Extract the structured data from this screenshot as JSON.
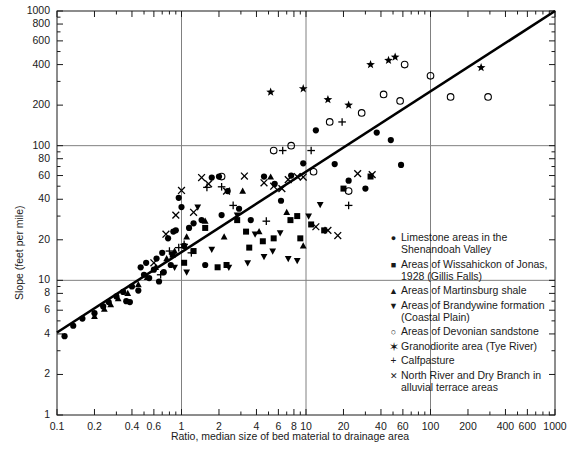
{
  "chart_data": {
    "type": "scatter",
    "title": "",
    "xlabel": "Ratio, median size of bed material to drainage area",
    "ylabel": "Slope (feet per mile)",
    "xscale": "log",
    "yscale": "log",
    "xlim": [
      0.1,
      1000
    ],
    "ylim": [
      1,
      1000
    ],
    "grid": "major lines at x=1, x=10, x=100 and y=10, y=100",
    "xticks": [
      0.1,
      0.2,
      0.4,
      0.6,
      1,
      2,
      4,
      6,
      8,
      10,
      20,
      40,
      60,
      100,
      200,
      400,
      600,
      1000
    ],
    "xticklabels": [
      "0.1",
      "0.2",
      "0.4",
      "0.6",
      "1",
      "2",
      "4",
      "6",
      "8",
      "10",
      "20",
      "40",
      "60",
      "100",
      "200",
      "400",
      "600",
      "1000"
    ],
    "yticks": [
      1,
      2,
      4,
      6,
      8,
      10,
      20,
      40,
      60,
      80,
      100,
      200,
      400,
      600,
      800,
      1000
    ],
    "yticklabels": [
      "1",
      "2",
      "4",
      "6",
      "8",
      "10",
      "20",
      "40",
      "60",
      "80",
      "100",
      "200",
      "400",
      "600",
      "800",
      "1000"
    ],
    "legend_position": "lower right, inside axes",
    "trendline": {
      "x": [
        0.1,
        1000
      ],
      "y": [
        4.1,
        1000
      ],
      "style": "solid",
      "width": 2.6,
      "color": "#000000"
    },
    "series": [
      {
        "name": "Limestone areas in the Shenandoah Valley",
        "marker": "filled-circle",
        "points": [
          [
            0.115,
            3.85
          ],
          [
            0.135,
            4.6
          ],
          [
            0.16,
            5.2
          ],
          [
            0.2,
            5.7
          ],
          [
            0.235,
            6.4
          ],
          [
            0.26,
            6.9
          ],
          [
            0.3,
            7.6
          ],
          [
            0.34,
            8.2
          ],
          [
            0.36,
            7.0
          ],
          [
            0.385,
            6.9
          ],
          [
            0.4,
            9.0
          ],
          [
            0.45,
            8.4
          ],
          [
            0.47,
            12.5
          ],
          [
            0.5,
            11.0
          ],
          [
            0.52,
            13.5
          ],
          [
            0.55,
            10.4
          ],
          [
            0.6,
            12.0
          ],
          [
            0.63,
            14.5
          ],
          [
            0.66,
            9.8
          ],
          [
            0.7,
            16.0
          ],
          [
            0.72,
            11.5
          ],
          [
            0.78,
            20.5
          ],
          [
            0.82,
            13.0
          ],
          [
            0.86,
            23.0
          ],
          [
            0.9,
            23.5
          ],
          [
            0.95,
            41.0
          ],
          [
            1.0,
            35.0
          ],
          [
            1.05,
            18.0
          ],
          [
            1.15,
            24.5
          ],
          [
            1.25,
            26.5
          ],
          [
            1.45,
            28.0
          ],
          [
            1.55,
            13.0
          ],
          [
            1.75,
            58.0
          ],
          [
            2.0,
            59.0
          ],
          [
            2.1,
            30.5
          ],
          [
            2.35,
            46.0
          ],
          [
            2.9,
            34.0
          ],
          [
            3.6,
            28.0
          ],
          [
            4.6,
            59.0
          ],
          [
            5.6,
            52.0
          ],
          [
            6.3,
            39.0
          ],
          [
            7.6,
            60.0
          ],
          [
            9.5,
            74.0
          ],
          [
            12.0,
            130.0
          ],
          [
            17.0,
            73.0
          ],
          [
            22.0,
            55.0
          ],
          [
            30.0,
            48.0
          ],
          [
            37.0,
            125.0
          ],
          [
            48.0,
            110.0
          ],
          [
            58.0,
            72.0
          ]
        ]
      },
      {
        "name": "Areas of Wissahickon of Jonas, 1928 (Gillis Falls)",
        "marker": "filled-square",
        "points": [
          [
            0.85,
            15.5
          ],
          [
            1.05,
            13.5
          ],
          [
            1.25,
            16.5
          ],
          [
            1.55,
            24.5
          ],
          [
            1.95,
            12.5
          ],
          [
            2.3,
            13.0
          ],
          [
            2.8,
            28.0
          ],
          [
            3.3,
            23.0
          ],
          [
            3.5,
            17.5
          ],
          [
            4.5,
            19.5
          ],
          [
            5.5,
            20.5
          ],
          [
            7.5,
            28.0
          ],
          [
            8.5,
            30.0
          ],
          [
            9.0,
            20.5
          ],
          [
            11.0,
            26.0
          ],
          [
            14.0,
            23.5
          ],
          [
            20.0,
            48.0
          ],
          [
            33.0,
            59.0
          ]
        ]
      },
      {
        "name": "Areas of Martinsburg shale",
        "marker": "filled-triangle-up",
        "points": [
          [
            0.2,
            5.4
          ],
          [
            0.24,
            6.1
          ],
          [
            0.27,
            6.6
          ],
          [
            0.31,
            7.3
          ],
          [
            0.37,
            8.0
          ],
          [
            0.45,
            9.3
          ],
          [
            0.53,
            10.5
          ],
          [
            0.62,
            12.5
          ],
          [
            0.76,
            14.5
          ],
          [
            0.88,
            16.5
          ],
          [
            1.1,
            21.0
          ],
          [
            1.55,
            27.5
          ],
          [
            2.2,
            21.0
          ],
          [
            3.1,
            46.0
          ],
          [
            4.2,
            23.0
          ],
          [
            5.2,
            58.5
          ],
          [
            7.0,
            32.0
          ],
          [
            9.5,
            18.0
          ]
        ]
      },
      {
        "name": "Areas of Brandywine formation (Coastal Plain)",
        "marker": "filled-triangle-down",
        "points": [
          [
            0.88,
            12.5
          ],
          [
            1.1,
            11.5
          ],
          [
            1.35,
            35.0
          ],
          [
            1.75,
            17.0
          ],
          [
            2.4,
            12.5
          ],
          [
            2.8,
            30.5
          ],
          [
            3.4,
            13.5
          ],
          [
            3.9,
            22.0
          ],
          [
            4.6,
            15.0
          ],
          [
            5.4,
            16.5
          ],
          [
            6.2,
            22.5
          ],
          [
            7.2,
            14.5
          ],
          [
            8.5,
            14.0
          ],
          [
            10.5,
            30.0
          ],
          [
            13.0,
            36.5
          ]
        ]
      },
      {
        "name": "Areas of Devonian sandstone",
        "marker": "open-circle",
        "points": [
          [
            2.1,
            59.0
          ],
          [
            5.5,
            92.0
          ],
          [
            7.6,
            100.0
          ],
          [
            11.5,
            64.0
          ],
          [
            15.5,
            150.0
          ],
          [
            22.0,
            46.0
          ],
          [
            28.0,
            175.0
          ],
          [
            42.0,
            240.0
          ],
          [
            57.0,
            215.0
          ],
          [
            100.0,
            330.0
          ],
          [
            145.0,
            230.0
          ],
          [
            290.0,
            230.0
          ],
          [
            62.0,
            400.0
          ]
        ]
      },
      {
        "name": "Granodiorite area (Tye River)",
        "marker": "star",
        "points": [
          [
            5.2,
            250.0
          ],
          [
            9.5,
            265.0
          ],
          [
            15.0,
            220.0
          ],
          [
            22.0,
            200.0
          ],
          [
            33.0,
            400.0
          ],
          [
            46.0,
            430.0
          ],
          [
            52.0,
            455.0
          ],
          [
            255.0,
            380.0
          ]
        ]
      },
      {
        "name": "Calfpasture",
        "marker": "plus",
        "points": [
          [
            0.68,
            11.0
          ],
          [
            0.8,
            16.5
          ],
          [
            0.95,
            17.5
          ],
          [
            1.05,
            18.5
          ],
          [
            1.2,
            16.0
          ],
          [
            1.6,
            49.0
          ],
          [
            2.1,
            49.5
          ],
          [
            2.6,
            36.0
          ],
          [
            4.8,
            27.5
          ],
          [
            6.5,
            92.0
          ],
          [
            11.0,
            92.0
          ],
          [
            19.5,
            150.0
          ],
          [
            22.0,
            36.0
          ]
        ]
      },
      {
        "name": "North River and Dry Branch in alluvial terrace areas",
        "marker": "cross-x",
        "points": [
          [
            0.6,
            13.5
          ],
          [
            0.75,
            22.0
          ],
          [
            0.9,
            30.5
          ],
          [
            1.0,
            46.5
          ],
          [
            1.25,
            32.0
          ],
          [
            1.45,
            58.0
          ],
          [
            1.65,
            52.0
          ],
          [
            2.3,
            46.0
          ],
          [
            3.2,
            59.5
          ],
          [
            4.6,
            53.0
          ],
          [
            5.5,
            50.0
          ],
          [
            6.4,
            48.0
          ],
          [
            7.2,
            56.0
          ],
          [
            8.5,
            59.0
          ],
          [
            9.5,
            58.5
          ],
          [
            12.0,
            25.0
          ],
          [
            15.0,
            23.5
          ],
          [
            18.0,
            21.5
          ],
          [
            26.0,
            62.0
          ],
          [
            34.0,
            61.0
          ]
        ]
      }
    ]
  },
  "legend": {
    "entries": [
      {
        "marker": "●",
        "label": "Limestone areas in the\nShenandoah Valley"
      },
      {
        "marker": "■",
        "label": "Areas of Wissahickon of Jonas,\n1928 (Gillis Falls)"
      },
      {
        "marker": "▲",
        "label": "Areas of Martinsburg shale"
      },
      {
        "marker": "▼",
        "label": "Areas of Brandywine formation\n(Coastal Plain)"
      },
      {
        "marker": "○",
        "label": "Areas of Devonian sandstone"
      },
      {
        "marker": "✶",
        "label": "Granodiorite area (Tye River)"
      },
      {
        "marker": "+",
        "label": "Calfpasture"
      },
      {
        "marker": "✕",
        "label": "North River and Dry Branch in\nalluvial terrace areas"
      }
    ]
  },
  "colors": {
    "marker": "#000000",
    "axis": "#1a1a1a",
    "grid": "#808080",
    "background": "#ffffff"
  }
}
